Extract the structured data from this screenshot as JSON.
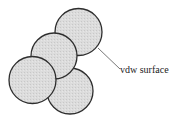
{
  "diagram": {
    "label": "vdw surface",
    "colors": {
      "fill": "#d9d9d9",
      "stroke": "#2e2e2e",
      "leader": "#555555"
    },
    "atoms": [
      {
        "id": "bottom-right",
        "cx": 70,
        "cy": 91,
        "r": 23
      },
      {
        "id": "top-right",
        "cx": 78.5,
        "cy": 32,
        "r": 23.5
      },
      {
        "id": "middle",
        "cx": 54,
        "cy": 56,
        "r": 23
      },
      {
        "id": "left",
        "cx": 32.5,
        "cy": 80,
        "r": 23.5
      }
    ],
    "leader_line": {
      "x1": 98,
      "y1": 48,
      "x2": 120,
      "y2": 69
    }
  }
}
